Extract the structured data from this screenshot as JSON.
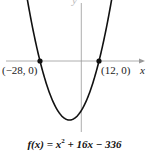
{
  "chart_data": {
    "type": "line",
    "function": "x^2 + 16x - 336",
    "xlabel": "x",
    "ylabel": "y",
    "grid": false,
    "x_intercepts": [
      {
        "label": "(−28, 0)",
        "x": -28,
        "y": 0
      },
      {
        "label": "(12, 0)",
        "x": 12,
        "y": 0
      }
    ],
    "vertex": {
      "x": -8,
      "y": -400
    },
    "xlim": [
      -55,
      46
    ],
    "ylim": [
      -470,
      415
    ],
    "series": [
      {
        "name": "f(x)",
        "x": [
          -36.5,
          -28,
          -20,
          -8,
          4,
          12,
          20.5
        ],
        "values": [
          413,
          0,
          -256,
          -400,
          -256,
          0,
          413
        ]
      }
    ]
  },
  "labels": {
    "left_intercept": "(−28, 0)",
    "right_intercept": "(12, 0)",
    "x_axis": "x",
    "y_axis": "y",
    "caption_prefix": "f(x) = x",
    "caption_exp": "2",
    "caption_suffix": " + 16x − 336"
  }
}
